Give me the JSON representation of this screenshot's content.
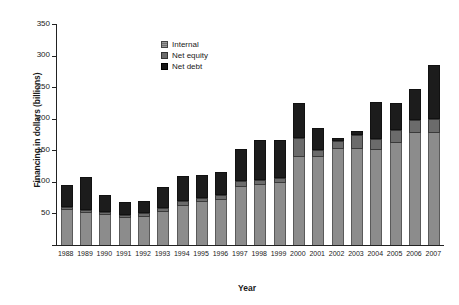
{
  "chart_data": {
    "type": "bar",
    "subtype": "stacked-vertical",
    "title": "",
    "xlabel": "Year",
    "ylabel": "Financing in dollars (billions)",
    "ylim": [
      0,
      350
    ],
    "yticks": [
      0,
      50,
      100,
      150,
      200,
      250,
      300,
      350
    ],
    "ytick_labels": [
      "",
      "50",
      "100",
      "150",
      "200",
      "250",
      "300",
      "350"
    ],
    "grid": false,
    "legend_position": "upper-center-left",
    "categories": [
      "1988",
      "1989",
      "1990",
      "1991",
      "1992",
      "1993",
      "1994",
      "1995",
      "1996",
      "1997",
      "1998",
      "1999",
      "2000",
      "2001",
      "2002",
      "2003",
      "2004",
      "2005",
      "2006",
      "2007"
    ],
    "series": [
      {
        "name": "Internal",
        "color": "#8c8c8c",
        "values": [
          55,
          50,
          48,
          42,
          45,
          52,
          62,
          68,
          72,
          92,
          95,
          98,
          140,
          140,
          152,
          152,
          150,
          162,
          178,
          178
        ]
      },
      {
        "name": "Net equity",
        "color": "#6b6b6b",
        "values": [
          5,
          6,
          4,
          5,
          6,
          7,
          8,
          7,
          8,
          10,
          8,
          8,
          30,
          10,
          12,
          23,
          18,
          20,
          20,
          22
        ]
      },
      {
        "name": "Net debt",
        "color": "#1c1c1c",
        "values": [
          35,
          52,
          28,
          21,
          18,
          33,
          40,
          36,
          36,
          50,
          63,
          60,
          55,
          35,
          6,
          5,
          58,
          43,
          49,
          85
        ]
      }
    ],
    "totals": [
      95,
      108,
      80,
      68,
      69,
      92,
      110,
      111,
      116,
      152,
      166,
      166,
      225,
      185,
      170,
      180,
      226,
      225,
      247,
      285
    ]
  },
  "legend": {
    "items": [
      {
        "label": "Internal",
        "swatch": "internal-swatch"
      },
      {
        "label": "Net equity",
        "swatch": "net-equity-swatch"
      },
      {
        "label": "Net debt",
        "swatch": "net-debt-swatch"
      }
    ]
  }
}
